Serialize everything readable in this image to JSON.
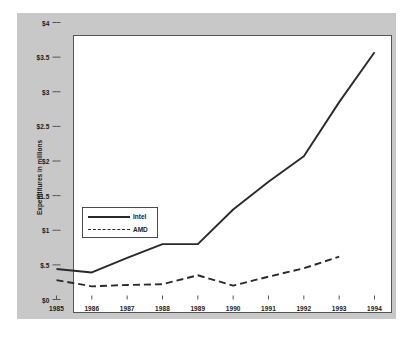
{
  "chart_data": {
    "type": "line",
    "title": "",
    "xlabel": "",
    "ylabel": "Expenditures in millions",
    "x": [
      1985,
      1986,
      1987,
      1988,
      1989,
      1990,
      1991,
      1992,
      1993,
      1994
    ],
    "xtick_labels": [
      "1985",
      "1986",
      "1987",
      "1988",
      "1989",
      "1990",
      "1991",
      "1992",
      "1993",
      "1994"
    ],
    "ytick_values": [
      0,
      0.5,
      1,
      1.5,
      2,
      2.5,
      3,
      3.5,
      4
    ],
    "ytick_labels": [
      "$0",
      "$.5",
      "$1",
      "$1.5",
      "$2",
      "$2.5",
      "$3",
      "$3.5",
      "$4"
    ],
    "ylim": [
      0,
      4
    ],
    "xlim": [
      1985,
      1994
    ],
    "grid": false,
    "legend_position": "center-left",
    "series": [
      {
        "name": "Intel",
        "style": "solid",
        "color": "#2a2a2a",
        "x": [
          1985,
          1986,
          1987,
          1988,
          1989,
          1990,
          1991,
          1992,
          1993,
          1994
        ],
        "values": [
          0.44,
          0.39,
          0.6,
          0.8,
          0.8,
          1.3,
          1.7,
          2.07,
          2.85,
          3.57
        ]
      },
      {
        "name": "AMD",
        "style": "dashed",
        "color": "#2a2a2a",
        "x": [
          1985,
          1986,
          1987,
          1988,
          1989,
          1990,
          1991,
          1992,
          1993
        ],
        "values": [
          0.28,
          0.19,
          0.21,
          0.22,
          0.35,
          0.2,
          0.33,
          0.45,
          0.62
        ]
      }
    ]
  },
  "figure": {
    "panel_color": "#c8c8c8",
    "canvas_color": "#ffffff",
    "axis_color": "#555555",
    "background_color": "#ffffff"
  },
  "legend": {
    "entries": [
      {
        "label": "Intel",
        "style": "solid"
      },
      {
        "label": "AMD",
        "style": "dashed"
      }
    ]
  }
}
